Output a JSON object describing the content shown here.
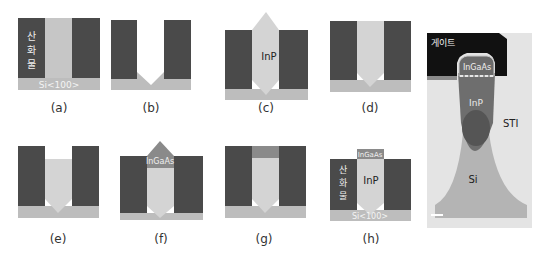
{
  "colors": {
    "oxide": "#4a4a4a",
    "substrate": "#bdbdbd",
    "inp": "#d4d4d4",
    "ingaas": "#8a8a8a",
    "tem_gate": "#151515",
    "tem_inp": "#6e6e6e",
    "tem_si": "#b0b0b0",
    "tem_bg": "#e6e6e6"
  },
  "panels": [
    {
      "id": "a",
      "caption": "(a)",
      "oxide_label": "산화물",
      "substrate_label": "Si<100>"
    },
    {
      "id": "b",
      "caption": "(b)"
    },
    {
      "id": "c",
      "caption": "(c)",
      "fill_label": "InP"
    },
    {
      "id": "d",
      "caption": "(d)"
    },
    {
      "id": "e",
      "caption": "(e)"
    },
    {
      "id": "f",
      "caption": "(f)",
      "cap_label": "InGaAs"
    },
    {
      "id": "g",
      "caption": "(g)"
    },
    {
      "id": "h",
      "caption": "(h)",
      "oxide_label": "산화물",
      "fill_label": "InP",
      "cap_label": "InGaAs",
      "substrate_label": "Si<100>"
    }
  ],
  "tem": {
    "gate_label": "게이트",
    "ingaas_label": "InGaAs",
    "inp_label": "InP",
    "sti_label": "STI",
    "si_label": "Si"
  }
}
